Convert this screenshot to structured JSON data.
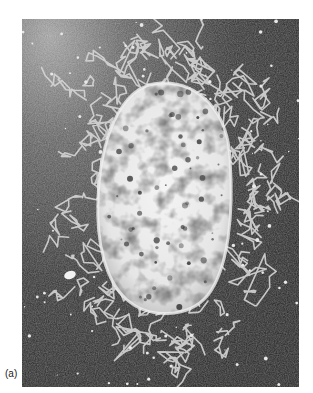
{
  "figure": {
    "panel_label": "(a)",
    "elements": {
      "background": "dark grainy field",
      "cell_body": "bright oval mass with dark mottled patches",
      "halo": "network of bright looped strands surrounding the cell body",
      "particle": "small bright oval particle at lower left",
      "speckles": "scattered bright dots across the field"
    },
    "colors": {
      "background_dark": "#262626",
      "background_light": "#8a8a8a",
      "strand": "#d9d9d9",
      "cell_bright": "#f2f2f2",
      "cell_shadow": "#5a5a5a",
      "page": "#ffffff",
      "label_text": "#222222"
    }
  }
}
